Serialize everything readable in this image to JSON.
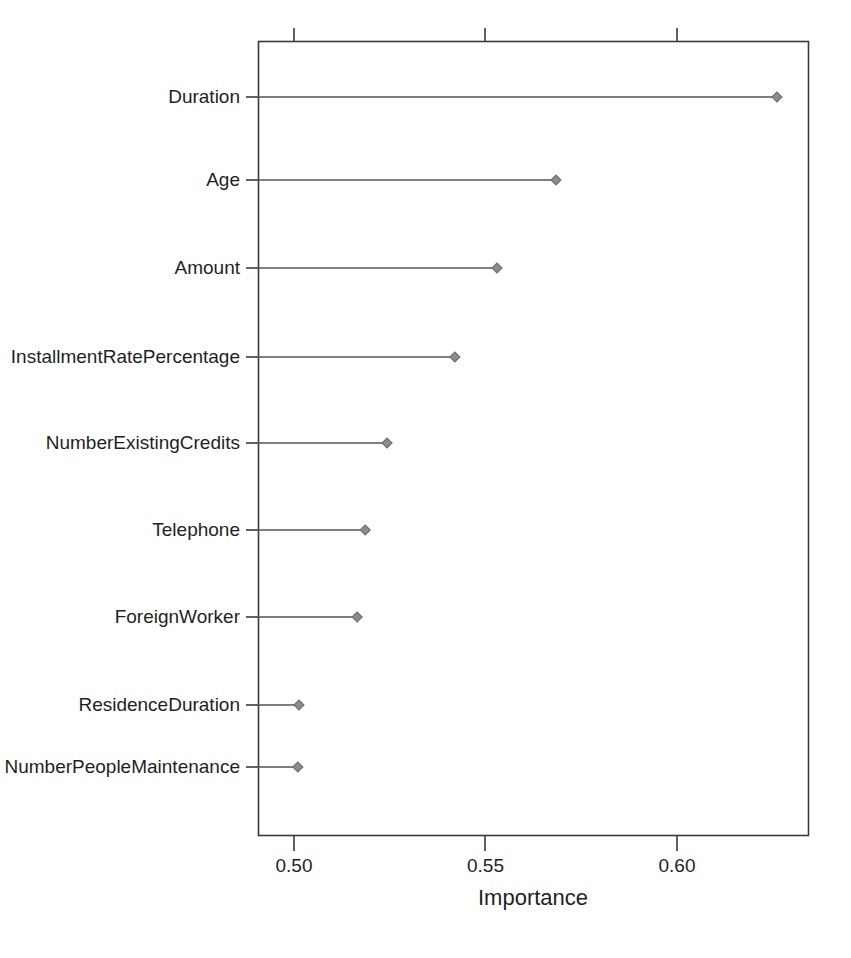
{
  "chart_data": {
    "type": "bar",
    "style": "lollipop-dotchart",
    "title": "",
    "subtitle": "",
    "xlabel": "Importance",
    "ylabel": "",
    "orientation": "horizontal",
    "grid": false,
    "legend": null,
    "xlim": [
      0.4989,
      0.6433
    ],
    "xticks": [
      0.5,
      0.55,
      0.6
    ],
    "xtick_labels": [
      "0.50",
      "0.55",
      "0.60"
    ],
    "baseline": 0.4989,
    "categories": [
      "Duration",
      "Age",
      "Amount",
      "InstallmentRatePercentage",
      "NumberExistingCredits",
      "Telephone",
      "ForeignWorker",
      "ResidenceDuration",
      "NumberPeopleMaintenance"
    ],
    "values": [
      0.6261,
      0.5684,
      0.553,
      0.542,
      0.5243,
      0.5186,
      0.5165,
      0.5013,
      0.501
    ],
    "marker": {
      "shape": "diamond",
      "fill_color": "#8c8c8c",
      "edge_color": "#6e6e6e",
      "size": 5
    },
    "line_color": "#555555",
    "frame_color": "#3a3a3a"
  },
  "figure": {
    "background_color": "#ffffff",
    "text_color": "#1f1f1f",
    "axis_title": "Importance"
  }
}
